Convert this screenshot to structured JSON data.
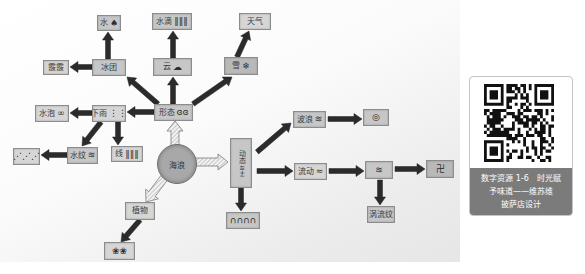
{
  "diagram": {
    "center": {
      "label": "海浪"
    },
    "nodes": {
      "water": {
        "label": "水",
        "glyph": "♠"
      },
      "droplet": {
        "label": "水滴",
        "glyph": "‖‖‖"
      },
      "weather": {
        "label": "天气",
        "glyph": ""
      },
      "ice": {
        "label": "冰团",
        "glyph": ""
      },
      "cloud": {
        "label": "云",
        "glyph": "☁"
      },
      "snow": {
        "label": "雪",
        "glyph": "❄"
      },
      "hail": {
        "label": "霰霰",
        "glyph": ""
      },
      "rain": {
        "label": "下雨",
        "glyph": "⋮⋮"
      },
      "bubble": {
        "label": "水泡",
        "glyph": "∞"
      },
      "form": {
        "label": "形态",
        "glyph": "ɞɞ"
      },
      "ripple": {
        "label": "水纹",
        "glyph": "≋"
      },
      "line": {
        "label": "线",
        "glyph": "‖‖‖"
      },
      "grass": {
        "label": "",
        "glyph": "⋰⋰⋰"
      },
      "plant": {
        "label": "植物",
        "glyph": ""
      },
      "coral": {
        "label": "",
        "glyph": "❀❀"
      },
      "motion": {
        "label": "动态",
        "glyph": "≀≀≀+≀"
      },
      "arch": {
        "label": "",
        "glyph": "∩∩∩∩"
      },
      "wave": {
        "label": "波浪",
        "glyph": "≋"
      },
      "spiral": {
        "label": "",
        "glyph": "◎"
      },
      "flow": {
        "label": "流动",
        "glyph": "≈"
      },
      "waves": {
        "label": "",
        "glyph": "≋"
      },
      "swastika": {
        "label": "",
        "glyph": "卍"
      },
      "vortex": {
        "label": "涡流纹",
        "glyph": ""
      }
    }
  },
  "qr_card": {
    "icon": "qr-code",
    "caption_lines": [
      "数字资源 1-6　时光赋",
      "予味道——维苏维",
      "披萨店设计"
    ]
  }
}
